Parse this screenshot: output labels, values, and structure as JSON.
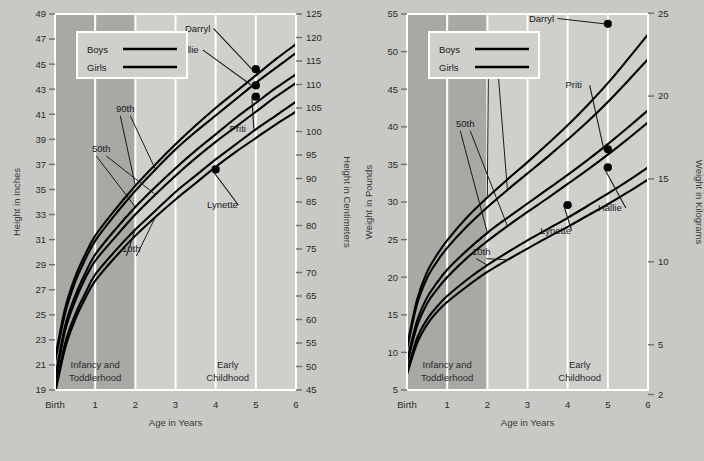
{
  "figure": {
    "background_color": "#c8c8c4",
    "plot_background_color": "#cfcfcb",
    "shaded_band_color": "#a8a8a4",
    "gridline_color": "#ffffff",
    "curve_color": "#000000",
    "dot_color": "#000000"
  },
  "panels": [
    {
      "id": "height",
      "legend": {
        "items": [
          {
            "label": "Boys"
          },
          {
            "label": "Girls"
          }
        ]
      },
      "x_axis": {
        "title": "Age in Years",
        "tick_labels": [
          "Birth",
          "1",
          "2",
          "3",
          "4",
          "5",
          "6"
        ],
        "values": [
          0,
          1,
          2,
          3,
          4,
          5,
          6
        ],
        "min": 0,
        "max": 6
      },
      "y_axis_left": {
        "title": "Height in Inches",
        "tick_labels": [
          "19",
          "21",
          "23",
          "25",
          "27",
          "29",
          "31",
          "33",
          "35",
          "37",
          "39",
          "41",
          "43",
          "45",
          "47",
          "49"
        ],
        "values": [
          19,
          21,
          23,
          25,
          27,
          29,
          31,
          33,
          35,
          37,
          39,
          41,
          43,
          45,
          47,
          49
        ],
        "min": 19,
        "max": 49
      },
      "y_axis_right": {
        "title": "Height in Centimeters",
        "tick_labels": [
          "45",
          "50",
          "55",
          "60",
          "65",
          "70",
          "75",
          "80",
          "85",
          "90",
          "95",
          "100",
          "105",
          "110",
          "115",
          "120",
          "125"
        ],
        "values": [
          45,
          50,
          55,
          60,
          65,
          70,
          75,
          80,
          85,
          90,
          95,
          100,
          105,
          110,
          115,
          120,
          125
        ],
        "min": 45,
        "max": 125
      },
      "stage_bands": [
        {
          "label_line1": "Infancy and",
          "label_line2": "Toddlerhood",
          "x_start": 0,
          "x_end": 2,
          "shaded": true
        },
        {
          "label_line1": "Early",
          "label_line2": "Childhood",
          "x_start": 3,
          "x_end": 5.6,
          "shaded": false
        }
      ],
      "percentile_labels": [
        {
          "text": "90th",
          "x": 1.75,
          "y": 41.2
        },
        {
          "text": "50th",
          "x": 1.15,
          "y": 38.0
        },
        {
          "text": "10th",
          "x": 1.9,
          "y": 30.0
        }
      ],
      "chart_data": {
        "type": "line",
        "title": "Height for age, birth to 6 years",
        "xlabel": "Age in Years",
        "ylabel": "Height in Inches",
        "ylabel_secondary": "Height in Centimeters",
        "xlim": [
          0,
          6
        ],
        "ylim": [
          19,
          49
        ],
        "ylim_secondary": [
          45,
          125
        ],
        "grid": true,
        "legend_position": "top-left",
        "x": [
          0,
          0.25,
          0.5,
          0.75,
          1,
          1.5,
          2,
          2.5,
          3,
          3.5,
          4,
          4.5,
          5,
          5.5,
          6
        ],
        "series": [
          {
            "name": "Boys 90th",
            "sex": "boys",
            "percentile": 90,
            "values": [
              21.5,
              25.5,
              28.0,
              29.8,
              31.3,
              33.4,
              35.3,
              37.0,
              38.6,
              40.1,
              41.5,
              42.8,
              44.1,
              45.4,
              46.6
            ]
          },
          {
            "name": "Girls 90th",
            "sex": "girls",
            "percentile": 90,
            "values": [
              21.2,
              25.1,
              27.6,
              29.4,
              30.9,
              33.0,
              34.9,
              36.6,
              38.2,
              39.6,
              40.9,
              42.2,
              43.5,
              44.7,
              45.9
            ]
          },
          {
            "name": "Boys 50th",
            "sex": "boys",
            "percentile": 50,
            "values": [
              19.9,
              24.1,
              26.5,
              28.3,
              29.8,
              31.8,
              33.6,
              35.2,
              36.7,
              38.1,
              39.4,
              40.7,
              41.9,
              43.1,
              44.2
            ]
          },
          {
            "name": "Girls 50th",
            "sex": "girls",
            "percentile": 50,
            "values": [
              19.6,
              23.7,
              26.1,
              27.9,
              29.3,
              31.2,
              33.0,
              34.6,
              36.1,
              37.5,
              38.8,
              40.0,
              41.2,
              42.4,
              43.5
            ]
          },
          {
            "name": "Boys 10th",
            "sex": "boys",
            "percentile": 10,
            "values": [
              18.9,
              22.7,
              25.0,
              26.7,
              28.2,
              30.1,
              31.8,
              33.3,
              34.8,
              36.1,
              37.4,
              38.6,
              39.8,
              40.9,
              42.0
            ]
          },
          {
            "name": "Girls 10th",
            "sex": "girls",
            "percentile": 10,
            "values": [
              18.7,
              22.3,
              24.6,
              26.3,
              27.7,
              29.6,
              31.3,
              32.8,
              34.2,
              35.5,
              36.8,
              38.0,
              39.1,
              40.2,
              41.2
            ]
          }
        ],
        "annotated_points": [
          {
            "name": "Darryl",
            "x": 5,
            "y": 44.6,
            "label_x": 3.55,
            "label_y": 47.6,
            "leader": true
          },
          {
            "name": "Hallie",
            "x": 5,
            "y": 43.3,
            "label_x": 3.28,
            "label_y": 45.9,
            "leader": true
          },
          {
            "name": "Priti",
            "x": 5,
            "y": 42.4,
            "label_x": 4.55,
            "label_y": 39.6,
            "leader": true
          },
          {
            "name": "Lynette",
            "x": 4.0,
            "y": 36.6,
            "label_x": 4.17,
            "label_y": 33.5,
            "leader": true
          }
        ]
      }
    },
    {
      "id": "weight",
      "legend": {
        "items": [
          {
            "label": "Boys"
          },
          {
            "label": "Girls"
          }
        ]
      },
      "x_axis": {
        "title": "Age in Years",
        "tick_labels": [
          "Birth",
          "1",
          "2",
          "3",
          "4",
          "5",
          "6"
        ],
        "values": [
          0,
          1,
          2,
          3,
          4,
          5,
          6
        ],
        "min": 0,
        "max": 6
      },
      "y_axis_left": {
        "title": "Weight in Pounds",
        "tick_labels": [
          "5",
          "10",
          "15",
          "20",
          "25",
          "30",
          "35",
          "40",
          "45",
          "50",
          "55"
        ],
        "values": [
          5,
          10,
          15,
          20,
          25,
          30,
          35,
          40,
          45,
          50,
          55
        ],
        "min": 5,
        "max": 55
      },
      "y_axis_right": {
        "title": "Weight in Kilograms",
        "tick_labels": [
          "2",
          "5",
          "10",
          "15",
          "20",
          "25"
        ],
        "values": [
          2,
          5,
          10,
          15,
          20,
          25
        ],
        "min": 2.27,
        "max": 24.95
      },
      "stage_bands": [
        {
          "label_line1": "Infancy and",
          "label_line2": "Toddlerhood",
          "x_start": 0,
          "x_end": 2,
          "shaded": true
        },
        {
          "label_line1": "Early",
          "label_line2": "Childhood",
          "x_start": 3,
          "x_end": 5.6,
          "shaded": false
        }
      ],
      "percentile_labels": [
        {
          "text": "90th",
          "x": 2.15,
          "y": 47.3
        },
        {
          "text": "50th",
          "x": 1.45,
          "y": 40.0
        },
        {
          "text": "10th",
          "x": 1.85,
          "y": 23.0
        }
      ],
      "chart_data": {
        "type": "line",
        "title": "Weight for age, birth to 6 years",
        "xlabel": "Age in Years",
        "ylabel": "Weight in Pounds",
        "ylabel_secondary": "Weight in Kilograms",
        "xlim": [
          0,
          6
        ],
        "ylim": [
          5,
          55
        ],
        "ylim_secondary": [
          2,
          25
        ],
        "grid": true,
        "legend_position": "top-left",
        "x": [
          0,
          0.25,
          0.5,
          0.75,
          1,
          1.5,
          2,
          2.5,
          3,
          3.5,
          4,
          4.5,
          5,
          5.5,
          6
        ],
        "series": [
          {
            "name": "Boys 90th",
            "sex": "boys",
            "percentile": 90,
            "values": [
              10.8,
              17.0,
              20.7,
              23.0,
              24.9,
              28.0,
              30.6,
              33.0,
              35.3,
              37.7,
              40.2,
              42.9,
              45.8,
              49.0,
              52.3
            ]
          },
          {
            "name": "Girls 90th",
            "sex": "girls",
            "percentile": 90,
            "values": [
              10.4,
              16.4,
              19.9,
              22.1,
              23.9,
              26.8,
              29.3,
              31.6,
              33.8,
              36.0,
              38.3,
              40.7,
              43.3,
              46.1,
              49.0
            ]
          },
          {
            "name": "Boys 50th",
            "sex": "boys",
            "percentile": 50,
            "values": [
              8.9,
              14.2,
              17.3,
              19.3,
              21.0,
              23.6,
              25.9,
              27.9,
              29.8,
              31.7,
              33.6,
              35.6,
              37.7,
              39.9,
              42.2
            ]
          },
          {
            "name": "Girls 50th",
            "sex": "girls",
            "percentile": 50,
            "values": [
              8.5,
              13.5,
              16.5,
              18.4,
              20.0,
              22.6,
              24.8,
              26.8,
              28.7,
              30.5,
              32.4,
              34.3,
              36.3,
              38.4,
              40.6
            ]
          },
          {
            "name": "Boys 10th",
            "sex": "boys",
            "percentile": 10,
            "values": [
              7.4,
              11.9,
              14.4,
              16.1,
              17.5,
              19.7,
              21.6,
              23.3,
              24.9,
              26.4,
              27.9,
              29.5,
              31.1,
              32.8,
              34.6
            ]
          },
          {
            "name": "Girls 10th",
            "sex": "girls",
            "percentile": 10,
            "values": [
              7.1,
              11.2,
              13.7,
              15.4,
              16.7,
              18.8,
              20.7,
              22.3,
              23.8,
              25.3,
              26.7,
              28.2,
              29.7,
              31.3,
              33.0
            ]
          }
        ],
        "annotated_points": [
          {
            "name": "Darryl",
            "x": 5,
            "y": 53.7,
            "label_x": 3.35,
            "label_y": 54.0,
            "leader": true
          },
          {
            "name": "Priti",
            "x": 5,
            "y": 37.0,
            "label_x": 4.15,
            "label_y": 45.1,
            "leader": true
          },
          {
            "name": "Hallie",
            "x": 5,
            "y": 34.6,
            "label_x": 5.05,
            "label_y": 28.8,
            "leader": true
          },
          {
            "name": "Lynette",
            "x": 4.0,
            "y": 29.6,
            "label_x": 3.7,
            "label_y": 25.8,
            "leader": true
          }
        ]
      }
    }
  ]
}
